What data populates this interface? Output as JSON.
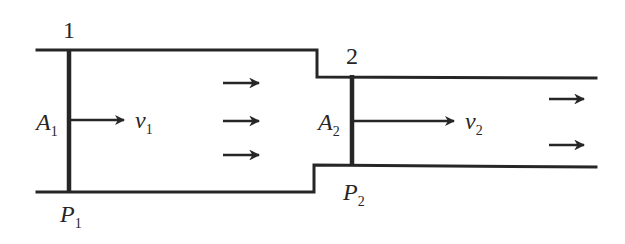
{
  "diagram": {
    "type": "fluid-flow-pipe-constriction",
    "colors": {
      "line": "#262626",
      "background": "#ffffff"
    },
    "sections": [
      {
        "id": "1",
        "number_label": "1",
        "area_label": {
          "symbol": "A",
          "subscript": "1"
        },
        "velocity_label": {
          "symbol": "v",
          "subscript": "1"
        },
        "pressure_label": {
          "symbol": "P",
          "subscript": "1"
        }
      },
      {
        "id": "2",
        "number_label": "2",
        "area_label": {
          "symbol": "A",
          "subscript": "2"
        },
        "velocity_label": {
          "symbol": "v",
          "subscript": "2"
        },
        "pressure_label": {
          "symbol": "P",
          "subscript": "2"
        }
      }
    ],
    "flow_arrows": {
      "wide_section_count": 3,
      "narrow_section_count": 2,
      "direction": "right"
    }
  }
}
